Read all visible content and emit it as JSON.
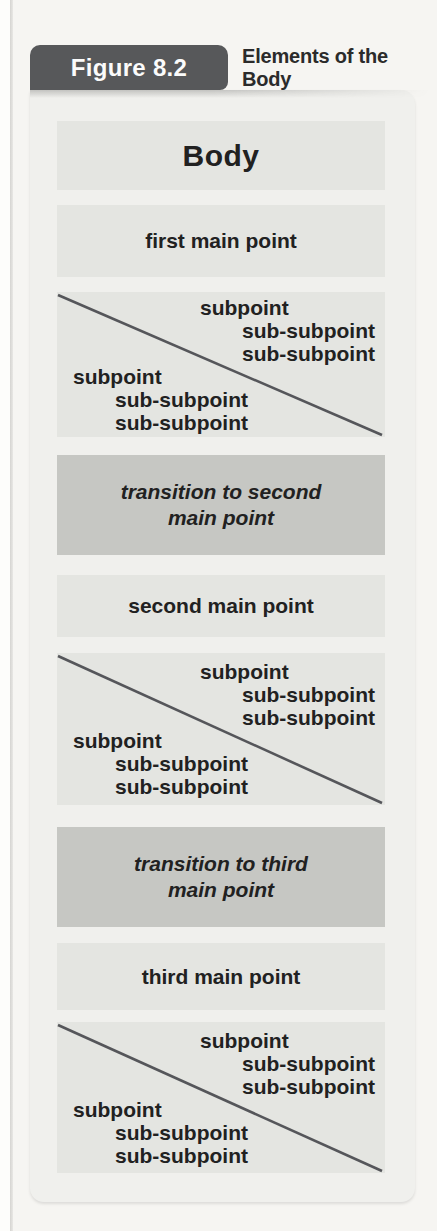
{
  "page": {
    "figure_label": "Figure 8.2",
    "figure_title": "Elements of the Body"
  },
  "colors": {
    "tab_bg": "#57585a",
    "tab_text": "#fbfbfb",
    "title_text": "#2b2b2b",
    "page_bg": "#f6f5f2",
    "panel_bg": "#f0f0ed",
    "box_bg": "#e4e5e1",
    "transition_bg": "#c6c7c3",
    "text": "#212121",
    "line": "#55565a"
  },
  "body_panel": {
    "title": "Body",
    "blocks": [
      {
        "kind": "main_point",
        "text": "first main point"
      },
      {
        "kind": "subpoints",
        "upper": [
          "subpoint",
          "sub-subpoint",
          "sub-subpoint"
        ],
        "lower": [
          "subpoint",
          "sub-subpoint",
          "sub-subpoint"
        ]
      },
      {
        "kind": "transition",
        "lines": [
          "transition to second",
          "main point"
        ]
      },
      {
        "kind": "main_point",
        "text": "second main point"
      },
      {
        "kind": "subpoints",
        "upper": [
          "subpoint",
          "sub-subpoint",
          "sub-subpoint"
        ],
        "lower": [
          "subpoint",
          "sub-subpoint",
          "sub-subpoint"
        ]
      },
      {
        "kind": "transition",
        "lines": [
          "transition to third",
          "main point"
        ]
      },
      {
        "kind": "main_point",
        "text": "third main point"
      },
      {
        "kind": "subpoints",
        "upper": [
          "subpoint",
          "sub-subpoint",
          "sub-subpoint"
        ],
        "lower": [
          "subpoint",
          "sub-subpoint",
          "sub-subpoint"
        ]
      }
    ]
  }
}
